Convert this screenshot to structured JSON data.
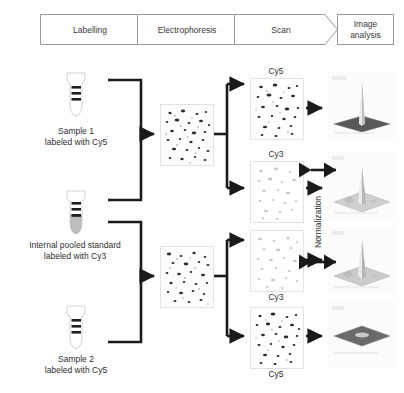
{
  "diagram": {
    "stages": [
      {
        "label": "Labelling",
        "shape": "chevron"
      },
      {
        "label": "Electrophoresis",
        "shape": "chevron"
      },
      {
        "label": "Scan",
        "shape": "chevron"
      },
      {
        "label": "Image\nanalysis",
        "shape": "rectangle"
      }
    ],
    "samples": [
      {
        "id": "sample-1",
        "caption": "Sample 1\nlabeled with Cy5",
        "dye": "Cy5",
        "fill": "none"
      },
      {
        "id": "standard",
        "caption": "Internal pooled standard\nlabeled with Cy3",
        "dye": "Cy3",
        "fill": "gray"
      },
      {
        "id": "sample-2",
        "caption": "Sample 2\nlabeled with Cy5",
        "dye": "Cy5",
        "fill": "none"
      }
    ],
    "gels": [
      {
        "id": "gel-1",
        "name": "gel-image-top"
      },
      {
        "id": "gel-2",
        "name": "gel-image-bottom"
      }
    ],
    "scans": [
      {
        "id": "scan-1",
        "dye": "Cy5",
        "label_position": "above",
        "intensity": "high"
      },
      {
        "id": "scan-2",
        "dye": "Cy3",
        "label_position": "above",
        "intensity": "low"
      },
      {
        "id": "scan-3",
        "dye": "Cy3",
        "label_position": "below",
        "intensity": "low"
      },
      {
        "id": "scan-4",
        "dye": "Cy5",
        "label_position": "below",
        "intensity": "high"
      }
    ],
    "analyses": [
      {
        "id": "surface-1",
        "peak": "tall",
        "base": "dark"
      },
      {
        "id": "surface-2",
        "peak": "medium",
        "base": "light"
      },
      {
        "id": "surface-3",
        "peak": "medium",
        "base": "light"
      },
      {
        "id": "surface-4",
        "peak": "flat",
        "base": "dark"
      }
    ],
    "normalization": {
      "label": "Normalization"
    },
    "colors": {
      "banner_border": "#9a9a9a",
      "banner_text": "#3a3a3a",
      "arrow": "#1a1a1a",
      "panel_border": "#e2e2e2",
      "spot": "#2b2b2b",
      "tube_outline": "#cfcfcf",
      "tube_fill": "#b9b9b9",
      "band": "#1f1f1f"
    }
  }
}
